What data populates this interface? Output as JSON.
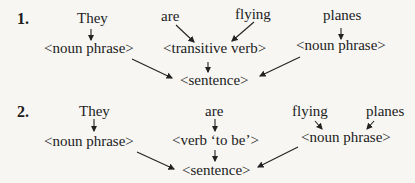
{
  "diagram1": {
    "number": "1.",
    "words": [
      "They",
      "are",
      "flying",
      "planes"
    ],
    "nodes": {
      "np1": "<noun phrase>",
      "tv": "<transitive verb>",
      "np2": "<noun phrase>",
      "s": "<sentence>"
    }
  },
  "diagram2": {
    "number": "2.",
    "words": [
      "They",
      "are",
      "flying",
      "planes"
    ],
    "nodes": {
      "np1": "<noun phrase>",
      "vb": "<verb ‘to be’>",
      "np2": "<noun phrase>",
      "s": "<sentence>"
    }
  }
}
